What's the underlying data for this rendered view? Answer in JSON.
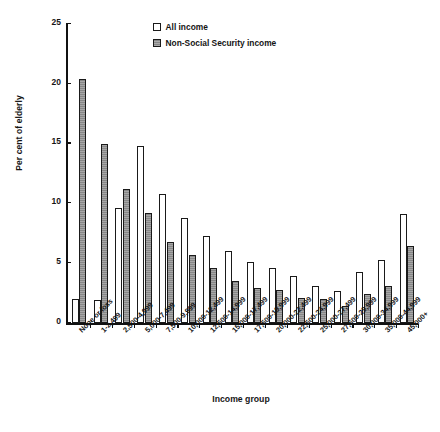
{
  "chart_data": {
    "type": "bar",
    "title": "",
    "xlabel": "Income group",
    "ylabel": "Per cent of elderly",
    "ylim": [
      0,
      25
    ],
    "yticks": [
      0,
      5,
      10,
      15,
      20,
      25
    ],
    "grid": false,
    "legend_position": "top-center",
    "categories": [
      "None or loss",
      "1-2,499",
      "2,500-4,999",
      "5,000-7,499",
      "7,500-9,999",
      "10,000-12,499",
      "12,500-14,999",
      "15,000-17,499",
      "17,500-19,999",
      "20,000-22,499",
      "22,500-24,999",
      "25,000-27,499",
      "27,500-29,999",
      "30,000-34,999",
      "35,000-44,999",
      "45,000+"
    ],
    "series": [
      {
        "name": "All income",
        "color": "#ffffff",
        "values": [
          2.0,
          1.9,
          9.6,
          14.8,
          10.8,
          8.8,
          7.3,
          6.0,
          5.1,
          4.6,
          3.9,
          3.1,
          2.7,
          4.3,
          5.3,
          9.1
        ]
      },
      {
        "name": "Non-Social Security income",
        "color": "#8e8e8e",
        "values": [
          20.4,
          15.0,
          11.2,
          9.2,
          6.8,
          5.7,
          4.6,
          3.5,
          2.9,
          2.8,
          2.1,
          2.0,
          1.4,
          2.4,
          3.1,
          6.4
        ]
      }
    ]
  },
  "legend": {
    "items": [
      {
        "label": "All income",
        "swatch": "open-square-swatch"
      },
      {
        "label": "Non-Social Security income",
        "swatch": "filled-square-swatch"
      }
    ]
  }
}
